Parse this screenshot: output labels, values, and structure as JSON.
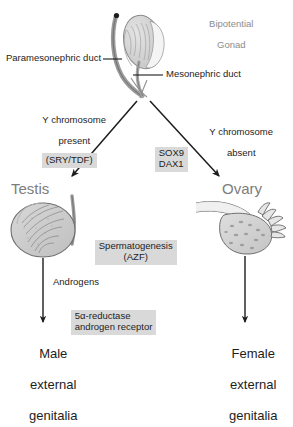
{
  "diagram": {
    "type": "flowchart"
  },
  "top": {
    "gonad_title_line1": "Bipotential",
    "gonad_title_line2": "Gonad",
    "paramesonephric_label": "Paramesonephric duct",
    "mesonephric_label": "Mesonephric duct"
  },
  "branches": {
    "left": {
      "condition_line1": "Y chromosome",
      "condition_line2": "present",
      "gene_box": "(SRY/TDF)",
      "organ": "Testis"
    },
    "right": {
      "condition_line1": "Y chromosome",
      "condition_line2": "absent",
      "organ": "Ovary"
    },
    "center_genes": {
      "gene1": "SOX9",
      "gene2": "DAX1"
    }
  },
  "male_path": {
    "spermatogenesis_line1": "Spermatogenesis",
    "spermatogenesis_line2": "(AZF)",
    "androgens_label": "Androgens",
    "androgen_box_line1": "5α-reductase",
    "androgen_box_line2": "androgen receptor",
    "outcome_line1": "Male",
    "outcome_line2": "external",
    "outcome_line3": "genitalia"
  },
  "female_path": {
    "outcome_line1": "Female",
    "outcome_line2": "external",
    "outcome_line3": "genitalia"
  },
  "icons": {
    "gonad": "bipotential-gonad-icon",
    "testis": "testis-icon",
    "ovary": "ovary-icon"
  },
  "colors": {
    "highlight": "#d9d9d9",
    "gray_text": "#8c8c8c",
    "dark_text": "#1d1d1d",
    "line": "#3a3a3a",
    "organ_fill": "#d0d0d0"
  }
}
